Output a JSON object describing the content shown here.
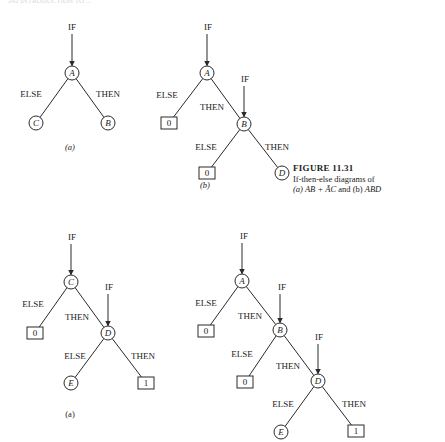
{
  "page_header": "242 INTRODUCTION TO ...",
  "caption": {
    "title": "FIGURE 11.31",
    "line1": "If-then-else diagrams of",
    "line2_prefix": "(a) ",
    "line2_expr_a": "AB + ĀC",
    "line2_mid": " and (b) ",
    "line2_expr_b": "ABD"
  },
  "labels": {
    "if": "IF",
    "then": "THEN",
    "else": "ELSE"
  },
  "diagrams": [
    {
      "id": "top-a",
      "sublabel": "(a)",
      "sublabel_italic": true,
      "sublabel_pos": [
        70,
        148
      ],
      "nodes": [
        {
          "id": "A",
          "type": "var",
          "text": "A",
          "x": 72,
          "y": 73
        },
        {
          "id": "C",
          "type": "var",
          "text": "C",
          "x": 36,
          "y": 123
        },
        {
          "id": "B",
          "type": "var",
          "text": "B",
          "x": 108,
          "y": 123
        }
      ],
      "ifs": [
        {
          "to": "A",
          "x": 72,
          "y": 28
        }
      ],
      "edges": [
        {
          "from": "A",
          "to": "C",
          "label": "ELSE",
          "lx": 31,
          "ly": 95
        },
        {
          "from": "A",
          "to": "B",
          "label": "THEN",
          "lx": 108,
          "ly": 95
        }
      ]
    },
    {
      "id": "top-b",
      "sublabel": "(b)",
      "sublabel_italic": true,
      "sublabel_pos": [
        205,
        186
      ],
      "nodes": [
        {
          "id": "A",
          "type": "var",
          "text": "A",
          "x": 207,
          "y": 73
        },
        {
          "id": "Z1",
          "type": "const",
          "text": "0",
          "x": 169,
          "y": 123
        },
        {
          "id": "B",
          "type": "var",
          "text": "B",
          "x": 244,
          "y": 124
        },
        {
          "id": "Z2",
          "type": "const",
          "text": "0",
          "x": 207,
          "y": 173
        },
        {
          "id": "D",
          "type": "var",
          "text": "D",
          "x": 282,
          "y": 173
        }
      ],
      "ifs": [
        {
          "to": "A",
          "x": 208,
          "y": 28
        },
        {
          "to": "B",
          "x": 245,
          "y": 80
        }
      ],
      "edges": [
        {
          "from": "A",
          "to": "Z1",
          "label": "ELSE",
          "lx": 167,
          "ly": 96
        },
        {
          "from": "A",
          "to": "B",
          "label": "THEN",
          "lx": 212,
          "ly": 108
        },
        {
          "from": "B",
          "to": "Z2",
          "label": "ELSE",
          "lx": 206,
          "ly": 148
        },
        {
          "from": "B",
          "to": "D",
          "label": "THEN",
          "lx": 277,
          "ly": 148
        }
      ]
    },
    {
      "id": "bottom-a",
      "sublabel": "(a)",
      "sublabel_italic": false,
      "sublabel_pos": [
        70,
        415
      ],
      "nodes": [
        {
          "id": "C",
          "type": "var",
          "text": "C",
          "x": 71,
          "y": 282
        },
        {
          "id": "Z1",
          "type": "const",
          "text": "0",
          "x": 35,
          "y": 333
        },
        {
          "id": "D",
          "type": "var",
          "text": "D",
          "x": 108,
          "y": 333
        },
        {
          "id": "E",
          "type": "var",
          "text": "E",
          "x": 71,
          "y": 383
        },
        {
          "id": "O1",
          "type": "const",
          "text": "1",
          "x": 146,
          "y": 383
        }
      ],
      "ifs": [
        {
          "to": "C",
          "x": 72,
          "y": 238
        },
        {
          "to": "D",
          "x": 109,
          "y": 288
        }
      ],
      "edges": [
        {
          "from": "C",
          "to": "Z1",
          "label": "ELSE",
          "lx": 33,
          "ly": 305
        },
        {
          "from": "C",
          "to": "D",
          "label": "THEN",
          "lx": 77,
          "ly": 318
        },
        {
          "from": "D",
          "to": "E",
          "label": "ELSE",
          "lx": 75,
          "ly": 357
        },
        {
          "from": "D",
          "to": "O1",
          "label": "THEN",
          "lx": 143,
          "ly": 357
        }
      ]
    },
    {
      "id": "bottom-b",
      "sublabel": "",
      "sublabel_italic": false,
      "sublabel_pos": [
        0,
        0
      ],
      "nodes": [
        {
          "id": "A",
          "type": "var",
          "text": "A",
          "x": 242,
          "y": 281
        },
        {
          "id": "Z1",
          "type": "const",
          "text": "0",
          "x": 206,
          "y": 331
        },
        {
          "id": "B",
          "type": "var",
          "text": "B",
          "x": 280,
          "y": 330
        },
        {
          "id": "Z2",
          "type": "const",
          "text": "0",
          "x": 245,
          "y": 382
        },
        {
          "id": "D",
          "type": "var",
          "text": "D",
          "x": 318,
          "y": 381
        },
        {
          "id": "E",
          "type": "var",
          "text": "E",
          "x": 281,
          "y": 432
        },
        {
          "id": "O1",
          "type": "const",
          "text": "1",
          "x": 356,
          "y": 431
        }
      ],
      "ifs": [
        {
          "to": "A",
          "x": 244,
          "y": 237
        },
        {
          "to": "B",
          "x": 282,
          "y": 288
        },
        {
          "to": "D",
          "x": 319,
          "y": 338
        }
      ],
      "edges": [
        {
          "from": "A",
          "to": "Z1",
          "label": "ELSE",
          "lx": 206,
          "ly": 304
        },
        {
          "from": "A",
          "to": "B",
          "label": "THEN",
          "lx": 250,
          "ly": 317
        },
        {
          "from": "B",
          "to": "Z2",
          "label": "ELSE",
          "lx": 242,
          "ly": 355
        },
        {
          "from": "B",
          "to": "D",
          "label": "THEN",
          "lx": 288,
          "ly": 367
        },
        {
          "from": "D",
          "to": "E",
          "label": "ELSE",
          "lx": 283,
          "ly": 405
        },
        {
          "from": "D",
          "to": "O1",
          "label": "THEN",
          "lx": 354,
          "ly": 405
        }
      ]
    }
  ]
}
